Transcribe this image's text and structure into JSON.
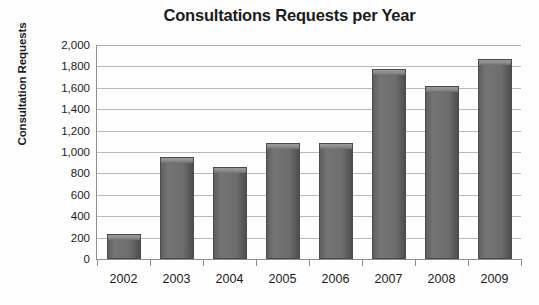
{
  "chart_data": {
    "type": "bar",
    "title": "Consultations Requests per Year",
    "xlabel": "",
    "ylabel": "Consultation Requests",
    "categories": [
      "2002",
      "2003",
      "2004",
      "2005",
      "2006",
      "2007",
      "2008",
      "2009"
    ],
    "values": [
      235,
      950,
      860,
      1080,
      1080,
      1780,
      1620,
      1870
    ],
    "series": [
      {
        "name": "Consultation Requests",
        "values": [
          235,
          950,
          860,
          1080,
          1080,
          1780,
          1620,
          1870
        ]
      }
    ],
    "ylim": [
      0,
      2000
    ],
    "ytick_step": 200,
    "ytick_labels": [
      "0",
      "200",
      "400",
      "600",
      "800",
      "1,000",
      "1,200",
      "1,400",
      "1,600",
      "1,800",
      "2,000"
    ],
    "ytick_values": [
      0,
      200,
      400,
      600,
      800,
      1000,
      1200,
      1400,
      1600,
      1800,
      2000
    ],
    "grid": true,
    "grid_axis": "y",
    "legend": false,
    "legend_position": "none",
    "bar_color": "#6d6d6d",
    "gridline_color": "#b9b9b9",
    "axis_color": "#8d8d8d",
    "background_color": "#ffffff",
    "text_color": "#1b1b1b"
  }
}
